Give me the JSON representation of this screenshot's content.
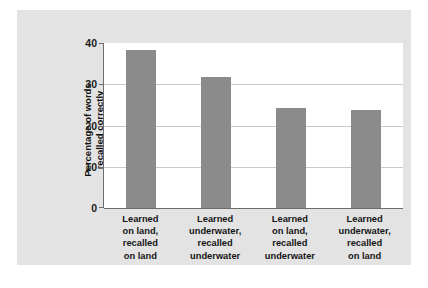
{
  "chart_data": {
    "type": "bar",
    "title": "",
    "subtitle": "",
    "xlabel": "",
    "ylabel": "Percentage of words recalled correctly",
    "ylabel_lines": [
      "Percentage of words",
      "recalled correctly"
    ],
    "categories": [
      "Learned on land, recalled on land",
      "Learned underwater, recalled underwater",
      "Learned on land, recalled underwater",
      "Learned underwater, recalled on land"
    ],
    "category_lines": [
      [
        "Learned",
        "on land,",
        "recalled",
        "on land"
      ],
      [
        "Learned",
        "underwater,",
        "recalled",
        "underwater"
      ],
      [
        "Learned",
        "on land,",
        "recalled",
        "underwater"
      ],
      [
        "Learned",
        "underwater,",
        "recalled",
        "on land"
      ]
    ],
    "values": [
      38.3,
      31.8,
      24.2,
      23.8
    ],
    "ylim": [
      0,
      40
    ],
    "yticks": [
      0,
      10,
      20,
      30,
      40
    ],
    "ytick_labels": [
      "0",
      "10",
      "20",
      "30",
      "40"
    ],
    "grid": true,
    "grid_axis": "y",
    "legend": false,
    "bar_color": "#8b8b8b",
    "plot_background": "#ffffff",
    "panel_background": "#e3e3e3",
    "axis_color": "#6d6d6d",
    "gridline_color": "#c9c9c9"
  }
}
